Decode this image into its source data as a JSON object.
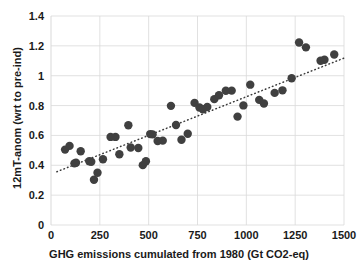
{
  "chart_data": {
    "type": "scatter",
    "title": "",
    "xlabel": "GHG emissions cumulated from 1980 (Gt CO2-eq)",
    "ylabel": "12mT-anom (wrt to pre-ind)",
    "xlim": [
      0,
      1500
    ],
    "ylim": [
      0,
      1.4
    ],
    "xticks": [
      0,
      250,
      500,
      750,
      1000,
      1250,
      1500
    ],
    "xtick_labels": [
      "0",
      "250",
      "500",
      "750",
      "1000",
      "1250",
      "1500"
    ],
    "yticks": [
      0,
      0.2,
      0.4,
      0.6,
      0.8,
      1,
      1.2,
      1.4
    ],
    "ytick_labels": [
      "0",
      "0.2",
      "0.4",
      "0.6",
      "0.8",
      "1",
      "1.2",
      "1.4"
    ],
    "grid": true,
    "grid_color": "#d9d9d9",
    "legend": null,
    "marker_color": "#404040",
    "marker_size": 4.2,
    "series": [
      {
        "name": "12mT-anom vs cumulated GHG emissions",
        "points": [
          [
            72,
            0.505
          ],
          [
            95,
            0.53
          ],
          [
            120,
            0.413
          ],
          [
            128,
            0.417
          ],
          [
            152,
            0.494
          ],
          [
            196,
            0.427
          ],
          [
            206,
            0.424
          ],
          [
            220,
            0.303
          ],
          [
            238,
            0.35
          ],
          [
            266,
            0.44
          ],
          [
            305,
            0.59
          ],
          [
            330,
            0.59
          ],
          [
            350,
            0.474
          ],
          [
            396,
            0.668
          ],
          [
            408,
            0.519
          ],
          [
            447,
            0.516
          ],
          [
            470,
            0.401
          ],
          [
            486,
            0.427
          ],
          [
            508,
            0.609
          ],
          [
            520,
            0.607
          ],
          [
            546,
            0.563
          ],
          [
            572,
            0.565
          ],
          [
            614,
            0.798
          ],
          [
            640,
            0.67
          ],
          [
            668,
            0.571
          ],
          [
            700,
            0.611
          ],
          [
            735,
            0.818
          ],
          [
            760,
            0.787
          ],
          [
            778,
            0.775
          ],
          [
            800,
            0.79
          ],
          [
            836,
            0.843
          ],
          [
            860,
            0.869
          ],
          [
            895,
            0.899
          ],
          [
            925,
            0.9
          ],
          [
            955,
            0.726
          ],
          [
            985,
            0.801
          ],
          [
            1020,
            0.94
          ],
          [
            1066,
            0.838
          ],
          [
            1090,
            0.814
          ],
          [
            1145,
            0.885
          ],
          [
            1185,
            0.902
          ],
          [
            1232,
            0.983
          ],
          [
            1270,
            1.222
          ],
          [
            1305,
            1.19
          ],
          [
            1380,
            1.1
          ],
          [
            1400,
            1.107
          ],
          [
            1450,
            1.142
          ]
        ]
      }
    ],
    "trendline": {
      "style": "dotted",
      "color": "#3a3a3a",
      "x_start": 30,
      "y_start": 0.357,
      "x_end": 1500,
      "y_end": 1.118
    }
  }
}
